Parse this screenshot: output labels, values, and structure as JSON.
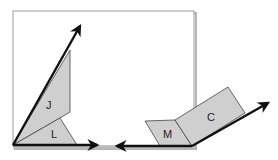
{
  "diagram": {
    "labels": {
      "J": "J",
      "L": "L",
      "M": "M",
      "C": "C"
    },
    "colors": {
      "shape_fill": "#cfcfcf",
      "stroke": "#111111",
      "frame": "#9a9a9a"
    }
  }
}
